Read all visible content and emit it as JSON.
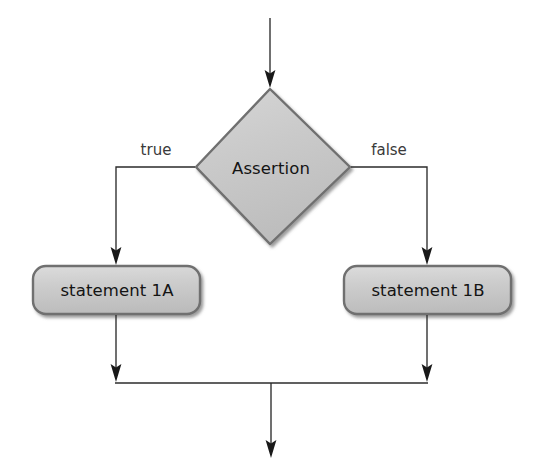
{
  "diagram": {
    "background_color": "#ffffff",
    "shape_fill_color": "#c9c9c9",
    "shape_border_color": "#6f6f6f",
    "line_color": "#2b2b2b",
    "text_color": "#141414",
    "edge_label_color": "#3a3a3a",
    "nodes": {
      "decision": {
        "label": "Assertion",
        "shape": "diamond"
      },
      "true_branch": {
        "label": "statement 1A",
        "shape": "rounded-rectangle"
      },
      "false_branch": {
        "label": "statement 1B",
        "shape": "rounded-rectangle"
      }
    },
    "edges": {
      "entry": {
        "label": ""
      },
      "true": {
        "label": "true"
      },
      "false": {
        "label": "false"
      },
      "merge_left": {
        "label": ""
      },
      "merge_right": {
        "label": ""
      },
      "exit": {
        "label": ""
      }
    }
  }
}
